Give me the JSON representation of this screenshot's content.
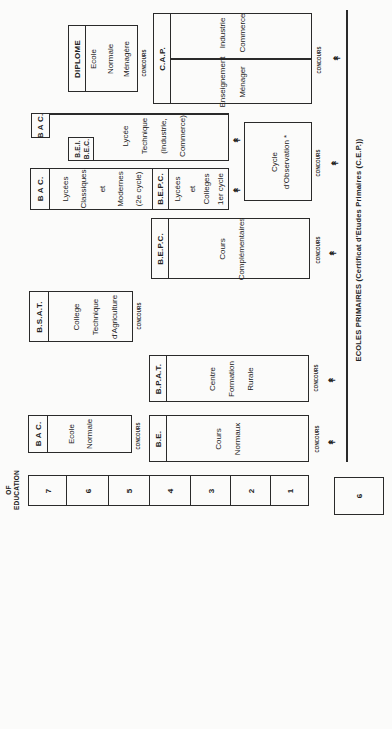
{
  "axis": {
    "label_line1": "OF",
    "label_line2": "EDUCATION",
    "years": [
      "7",
      "6",
      "5",
      "4",
      "3",
      "2",
      "1"
    ],
    "primary_years": "6"
  },
  "base": {
    "label": "ECOLES PRIMAIRES (Certificat d'Etudes Primaires (C.E.P.))"
  },
  "concours_label": "CONCOURS",
  "arrow_glyph": "↟",
  "boxes": {
    "diplome": {
      "header": "DIPLOME",
      "lines": [
        "Ecole",
        "Normale",
        "Ménagère"
      ]
    },
    "cap": {
      "header": "C.A.P.",
      "left": [
        "Enseignement",
        "Ménager"
      ],
      "right": [
        "Industrie",
        "Commerce"
      ]
    },
    "lycee_technique": {
      "header": "B A C.",
      "sub_header_1": "B.E.I.",
      "sub_header_2": "B.E.C.",
      "lines": [
        "Lycée",
        "Technique",
        "(Industrie,",
        "Commerce)"
      ]
    },
    "cycle_observation": {
      "lines": [
        "Cycle",
        "d'Observation *"
      ]
    },
    "lycees_classiques": {
      "header": "B A C.",
      "lines": [
        "Lycées",
        "Classiques",
        "et",
        "Modernes",
        "(2e cycle)"
      ]
    },
    "lycees_colleges": {
      "header": "B.E.P.C.",
      "lines": [
        "Lycées",
        "et",
        "Colleges",
        "1er cycle"
      ]
    },
    "cours_complementaires": {
      "header": "B.E.P.C.",
      "lines": [
        "Cours",
        "Complémentaires"
      ]
    },
    "college_agriculture": {
      "header": "B.S.A.T.",
      "lines": [
        "College",
        "Technique",
        "d'Agriculture"
      ]
    },
    "centre_formation": {
      "header": "B.P.A.T.",
      "lines": [
        "Centre",
        "Formation",
        "Rurale"
      ]
    },
    "ecole_normale": {
      "header": "B A C.",
      "lines": [
        "Ecole",
        "Normale"
      ]
    },
    "cours_normaux": {
      "header": "B.E.",
      "lines": [
        "Cours",
        "Normaux"
      ]
    }
  }
}
